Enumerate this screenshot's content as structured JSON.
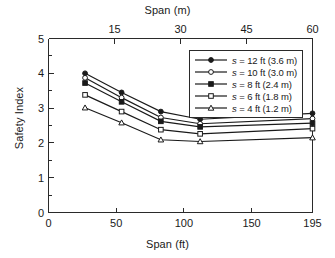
{
  "chart_data": {
    "type": "line",
    "title": "",
    "xlabel": "Span (ft)",
    "ylabel": "Safety Index",
    "secondary_xlabel": "Span (m)",
    "xlim": [
      0,
      195
    ],
    "ylim": [
      0,
      5
    ],
    "xticks": [
      0,
      50,
      100,
      150,
      195
    ],
    "xticklabels": [
      "0",
      "50",
      "100",
      "150",
      "195"
    ],
    "yticks": [
      0,
      1,
      2,
      3,
      4,
      5
    ],
    "yticklabels": [
      "0",
      "1",
      "2",
      "3",
      "4",
      "5"
    ],
    "y_minor_ticks": [
      0.5,
      1.5,
      2.5,
      3.5,
      4.5
    ],
    "top_xlim_m": [
      0,
      60
    ],
    "top_xticks_m": [
      15,
      30,
      45,
      60
    ],
    "top_xticklabels": [
      "15",
      "30",
      "45",
      "60"
    ],
    "grid": false,
    "legend_position": "upper right",
    "x": [
      27,
      54,
      83,
      112,
      195
    ],
    "series": [
      {
        "name": "s = 12 ft (3.6 m)",
        "label_symbol": "s",
        "label_rest": " = 12 ft (3.6 m)",
        "marker": "filled-circle",
        "values": [
          4.0,
          3.45,
          2.9,
          2.68,
          2.85
        ]
      },
      {
        "name": "s = 10 ft (3.0 m)",
        "label_symbol": "s",
        "label_rest": " = 10 ft (3.0 m)",
        "marker": "open-circle",
        "values": [
          3.87,
          3.3,
          2.73,
          2.55,
          2.7
        ]
      },
      {
        "name": "s = 8 ft (2.4 m)",
        "label_symbol": "s",
        "label_rest": " = 8 ft (2.4 m)",
        "marker": "filled-square",
        "values": [
          3.72,
          3.18,
          2.62,
          2.46,
          2.57
        ]
      },
      {
        "name": "s = 6 ft (1.8 m)",
        "label_symbol": "s",
        "label_rest": " = 6 ft (1.8 m)",
        "marker": "open-square",
        "values": [
          3.38,
          2.9,
          2.38,
          2.26,
          2.41
        ]
      },
      {
        "name": "s = 4 ft (1.2 m)",
        "label_symbol": "s",
        "label_rest": " = 4 ft (1.2 m)",
        "marker": "open-triangle",
        "values": [
          3.01,
          2.58,
          2.09,
          2.04,
          2.15
        ]
      }
    ],
    "colors": {
      "line": "#1a1a1a",
      "axis": "#2a2a2a",
      "background": "#ffffff"
    }
  }
}
